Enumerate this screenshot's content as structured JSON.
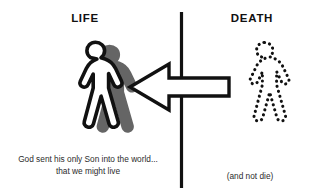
{
  "canvas": {
    "width": 309,
    "height": 196,
    "background": "#ffffff"
  },
  "colors": {
    "ink": "#111111",
    "caption": "#2b2b2b",
    "shadow": "#595959",
    "figure_fill": "#ffffff",
    "background": "#ffffff"
  },
  "headings": {
    "left": "LIFE",
    "right": "DEATH"
  },
  "captions": {
    "left_line1": "God sent his only Son into the world...",
    "left_line2": "that we might live",
    "right": "(and not die)"
  },
  "figures": {
    "life": {
      "icon": "walking-person-icon",
      "style": "solid-outline-with-shadow"
    },
    "death": {
      "icon": "walking-person-dotted-icon",
      "style": "dotted-outline"
    }
  },
  "arrow": {
    "icon": "block-arrow-left-icon",
    "direction": "left",
    "meaning": "death crosses over into life"
  },
  "divider": {
    "icon": "vertical-divider-line",
    "orientation": "vertical"
  }
}
